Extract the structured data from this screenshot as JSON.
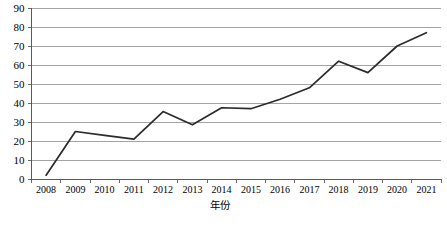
{
  "chart_data": {
    "type": "line",
    "title": "",
    "xlabel": "年份",
    "ylabel": "",
    "categories": [
      "2008",
      "2009",
      "2010",
      "2011",
      "2012",
      "2013",
      "2014",
      "2015",
      "2016",
      "2017",
      "2018",
      "2019",
      "2020",
      "2021"
    ],
    "values": [
      2,
      25,
      23,
      21,
      35.5,
      28.5,
      37.5,
      37,
      42,
      48,
      62,
      56,
      70,
      77
    ],
    "series": [
      {
        "name": "",
        "values": [
          2,
          25,
          23,
          21,
          35.5,
          28.5,
          37.5,
          37,
          42,
          48,
          62,
          56,
          70,
          77
        ]
      }
    ],
    "ylim": [
      0,
      90
    ],
    "yticks": [
      0,
      10,
      20,
      30,
      40,
      50,
      60,
      70,
      80,
      90
    ],
    "ytick_labels": [
      "0",
      "10",
      "20",
      "30",
      "40",
      "50",
      "60",
      "70",
      "80",
      "90"
    ],
    "xtick_labels": [
      "2008",
      "2009",
      "2010",
      "2011",
      "2012",
      "2013",
      "2014",
      "2015",
      "2016",
      "2017",
      "2018",
      "2019",
      "2020",
      "2021"
    ],
    "grid": true,
    "grid_axis": "y",
    "legend": false,
    "legend_position": "none",
    "line_color": "#2b2b2b",
    "grid_color": "#9a9a9a",
    "axis_color": "#5a5a5a",
    "background_color": "#ffffff"
  }
}
